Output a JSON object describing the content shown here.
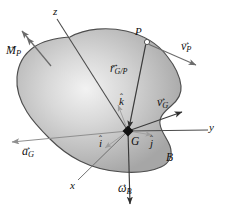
{
  "figure": {
    "type": "mechanics-free-body-diagram",
    "background_color": "#ffffff",
    "body": {
      "name": "rigid-body",
      "label": "B",
      "fill_center_color": "#f0f0f0",
      "fill_edge_color": "#a9a9a9",
      "outline_color": "#4a4a4a"
    },
    "points": [
      {
        "name": "center-of-mass",
        "label": "G",
        "marker": "filled-diamond"
      },
      {
        "name": "point-p",
        "label": "P",
        "marker": "open-circle"
      }
    ],
    "axes": [
      {
        "name": "x-axis",
        "label": "x"
      },
      {
        "name": "y-axis",
        "label": "y"
      },
      {
        "name": "z-axis",
        "label": "z"
      }
    ],
    "unit_vectors": [
      {
        "name": "i-hat",
        "base": "i",
        "accent": "hat",
        "color": "#9a9a9a"
      },
      {
        "name": "j-hat",
        "base": "j",
        "accent": "hat",
        "color": "#9a9a9a"
      },
      {
        "name": "k-hat",
        "base": "k",
        "accent": "hat",
        "color": "#9a9a9a"
      }
    ],
    "vectors": [
      {
        "name": "moment-at-p",
        "base": "M",
        "sub": "P",
        "accent": "arrow",
        "arrowheads": 2,
        "color": "#6e6e6e"
      },
      {
        "name": "velocity-of-p",
        "base": "v",
        "sub": "P",
        "accent": "arrow",
        "arrowheads": 1,
        "color": "#6e6e6e"
      },
      {
        "name": "position-g-relative-p",
        "base": "r",
        "sub": "G/P",
        "accent": "arrow",
        "arrowheads": 1,
        "color": "#3a3a3a"
      },
      {
        "name": "velocity-of-g",
        "base": "v",
        "sub": "G",
        "accent": "arrow",
        "arrowheads": 1,
        "color": "#3a3a3a"
      },
      {
        "name": "acceleration-of-g",
        "base": "a",
        "sub": "G",
        "accent": "arrow",
        "arrowheads": 1,
        "color": "#8a8a8a"
      },
      {
        "name": "angular-velocity-of-body",
        "base": "ω",
        "sub": "B",
        "accent": "double-arrow",
        "arrowheads": 1,
        "color": "#3a3a3a"
      }
    ],
    "labels": {
      "M_P_base": "M",
      "M_P_sub": "P",
      "v_P_base": "v",
      "v_P_sub": "P",
      "r_GP_base": "r",
      "r_GP_sub": "G/P",
      "v_G_base": "v",
      "v_G_sub": "G",
      "a_G_base": "a",
      "a_G_sub": "G",
      "omega_B_base": "ω",
      "omega_B_sub": "B",
      "i_hat": "i",
      "j_hat": "j",
      "k_hat": "k",
      "point_G": "G",
      "point_P": "P",
      "body_B": "B",
      "axis_x": "x",
      "axis_y": "y",
      "axis_z": "z",
      "arrow_accent": "→",
      "hat_accent": "ˆ"
    }
  }
}
